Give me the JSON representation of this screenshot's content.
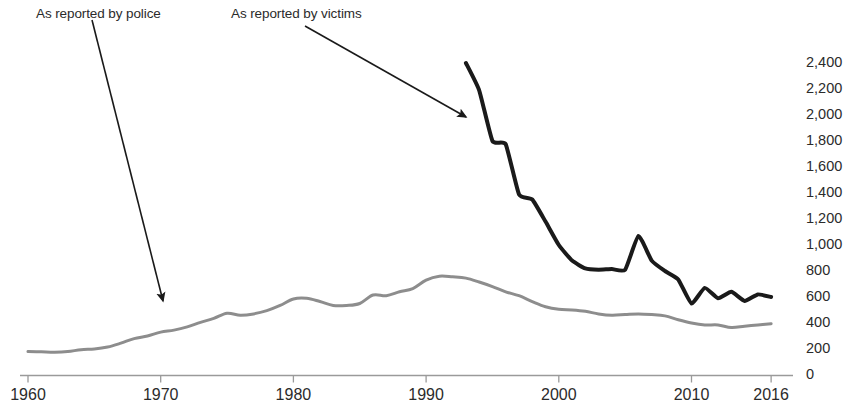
{
  "chart_data": {
    "type": "line",
    "title": "",
    "subtitle": "",
    "xlabel": "",
    "ylabel": "",
    "xlim": [
      1960,
      2016
    ],
    "ylim": [
      0,
      2400
    ],
    "grid": false,
    "legend_position": "annotations",
    "x_ticks": [
      "1960",
      "1970",
      "1980",
      "1990",
      "2000",
      "2010",
      "2016"
    ],
    "x_tick_values": [
      1960,
      1970,
      1980,
      1990,
      2000,
      2010,
      2016
    ],
    "y_ticks": [
      "0",
      "200",
      "400",
      "600",
      "800",
      "1,000",
      "1,200",
      "1,400",
      "1,600",
      "1,800",
      "2,000",
      "2,200",
      "2,400"
    ],
    "y_tick_values": [
      0,
      200,
      400,
      600,
      800,
      1000,
      1200,
      1400,
      1600,
      1800,
      2000,
      2200,
      2400
    ],
    "annotations": [
      {
        "id": "police",
        "text": "As reported by police",
        "arrow_from": [
          92,
          20
        ],
        "arrow_to": [
          163,
          301
        ]
      },
      {
        "id": "victims",
        "text": "As reported by victims",
        "arrow_from": [
          305,
          26
        ],
        "arrow_to": [
          466,
          117
        ]
      }
    ],
    "series": [
      {
        "name": "As reported by police",
        "color": "#8d8d8d",
        "width": 3,
        "x": [
          1960,
          1961,
          1962,
          1963,
          1964,
          1965,
          1966,
          1967,
          1968,
          1969,
          1970,
          1971,
          1972,
          1973,
          1974,
          1975,
          1976,
          1977,
          1978,
          1979,
          1980,
          1981,
          1982,
          1983,
          1984,
          1985,
          1986,
          1987,
          1988,
          1989,
          1990,
          1991,
          1992,
          1993,
          1994,
          1995,
          1996,
          1997,
          1998,
          1999,
          2000,
          2001,
          2002,
          2003,
          2004,
          2005,
          2006,
          2007,
          2008,
          2009,
          2010,
          2011,
          2012,
          2013,
          2014,
          2015,
          2016
        ],
        "values": [
          180,
          178,
          175,
          180,
          195,
          200,
          215,
          245,
          280,
          300,
          330,
          345,
          370,
          405,
          435,
          475,
          460,
          470,
          495,
          535,
          585,
          590,
          565,
          535,
          535,
          550,
          615,
          610,
          640,
          665,
          730,
          760,
          755,
          745,
          715,
          680,
          640,
          610,
          565,
          525,
          505,
          500,
          490,
          470,
          460,
          465,
          470,
          465,
          455,
          425,
          400,
          385,
          385,
          365,
          375,
          385,
          395
        ]
      },
      {
        "name": "As reported by victims",
        "color": "#1a1a1a",
        "width": 4,
        "x": [
          1993,
          1994,
          1995,
          1996,
          1997,
          1998,
          1999,
          2000,
          2001,
          2002,
          2003,
          2004,
          2005,
          2006,
          2007,
          2008,
          2009,
          2010,
          2011,
          2012,
          2013,
          2014,
          2015,
          2016
        ],
        "values": [
          2400,
          2190,
          1800,
          1775,
          1390,
          1350,
          1180,
          1000,
          880,
          820,
          810,
          815,
          810,
          1070,
          880,
          800,
          735,
          550,
          670,
          590,
          640,
          570,
          620,
          600
        ]
      }
    ]
  },
  "axis": {
    "baseline_color": "#9a9a9a",
    "tick_color": "#9a9a9a"
  }
}
